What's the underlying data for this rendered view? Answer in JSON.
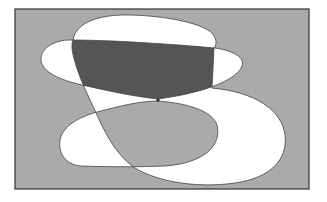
{
  "diagram": {
    "type": "overlapping-regions",
    "colors": {
      "background": "#aaaaaa",
      "white_region": "#ffffff",
      "dark_region": "#555555",
      "light_region": "#aaaaaa",
      "outline": "#333333",
      "page": "#ffffff"
    },
    "frame": {
      "x": 15,
      "y": 9,
      "width": 294,
      "height": 180
    },
    "regions": [
      {
        "id": "shape-a",
        "label": "",
        "fill": "white"
      },
      {
        "id": "shape-b",
        "label": "",
        "fill": "white"
      },
      {
        "id": "shape-c",
        "label": "",
        "fill": "white"
      },
      {
        "id": "a-and-b",
        "label": "",
        "fill": "dark"
      },
      {
        "id": "a-and-c",
        "label": "",
        "fill": "gray"
      }
    ]
  }
}
